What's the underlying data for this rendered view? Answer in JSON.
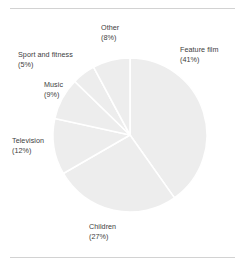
{
  "figure": {
    "name": "pie-chart-figure",
    "background": "#ffffff",
    "rule_color": "#d2d2d2",
    "slice_fill": "#ededed",
    "slice_edge": "#ffffff",
    "label_color": "#3c3c3c"
  },
  "chart_data": {
    "type": "pie",
    "title": "",
    "subtitle": "",
    "xlabel": "",
    "ylabel": "",
    "legend": "none",
    "grid": false,
    "start_angle_deg": 90,
    "direction": "clockwise",
    "center": {
      "x": 130,
      "y": 135
    },
    "radius": 77,
    "labels_position": "outside",
    "label_format": "name newline (percent%)",
    "categories": [
      "Feature film",
      "Children",
      "Television",
      "Music",
      "Sport and fitness",
      "Other"
    ],
    "values": [
      41,
      27,
      12,
      9,
      5,
      8
    ],
    "unit": "%",
    "slices": [
      {
        "name": "Feature film",
        "value": 41,
        "percent_label": "(41%)",
        "color": "#ededed"
      },
      {
        "name": "Children",
        "value": 27,
        "percent_label": "(27%)",
        "color": "#ededed"
      },
      {
        "name": "Television",
        "value": 12,
        "percent_label": "(12%)",
        "color": "#ededed"
      },
      {
        "name": "Music",
        "value": 9,
        "percent_label": "(9%)",
        "color": "#ededed"
      },
      {
        "name": "Sport and fitness",
        "value": 5,
        "percent_label": "(5%)",
        "color": "#ededed"
      },
      {
        "name": "Other",
        "value": 8,
        "percent_label": "(8%)",
        "color": "#ededed"
      }
    ]
  }
}
